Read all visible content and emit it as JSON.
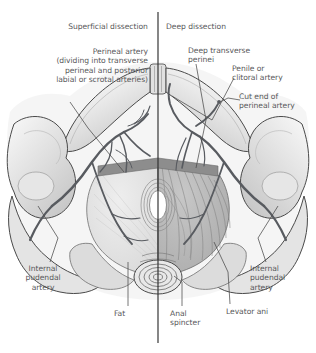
{
  "figure": {
    "orientation": "Anterior at top, posterior at bottom; midline vertical axis divides the two dissections."
  },
  "headings": {
    "left": "Superficial dissection",
    "right": "Deep dissection"
  },
  "labels": {
    "perineal_artery": "Perineal artery\n(dividing into transverse\nperineal and posterior\nlabial or scrotal arteries)",
    "deep_transverse_perinei": "Deep transverse\nperinei",
    "penile_or_clitoral_artery": "Penile or\nclitoral artery",
    "cut_end_of_perineal_artery": "Cut end of\nperineal artery",
    "internal_pudendal_artery_left": "Internal\npudendal\nartery",
    "internal_pudendal_artery_right": "Internal\npudendal\nartery",
    "fat": "Fat",
    "anal_sphincter": "Anal\nspincter",
    "levator_ani": "Levator ani"
  },
  "colors": {
    "label_text": "#58585a",
    "outline": "#3c3c3c",
    "leader_line": "#4a4a4a",
    "midline": "#2e2e2e",
    "artery_dark": "#585b60",
    "bone_light": "#ededed",
    "bone_shadow": "#d2d2d2",
    "superficial_fill": "#e2e2e2",
    "deep_muscle_fill": "#b9b9b9",
    "deep_transverse_band": "#8a8a8a",
    "fat_fill": "#dcdcdc",
    "orifice_white": "#ffffff",
    "background": "#ffffff"
  }
}
